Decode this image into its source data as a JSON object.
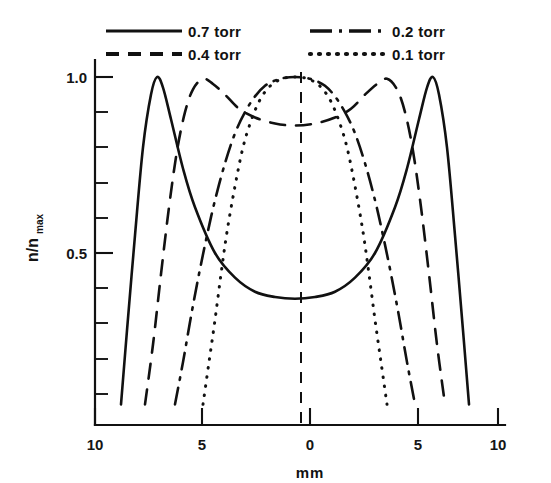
{
  "chart_data": {
    "type": "line",
    "title": "",
    "xlabel": "mm",
    "ylabel": "n/n max",
    "ylabel_main": "n/n",
    "ylabel_sub": "max",
    "xlim": [
      -10,
      10
    ],
    "ylim": [
      0,
      1.05
    ],
    "grid": false,
    "legend_position": "top",
    "x_ticks_major": [
      -10,
      -5,
      0,
      5,
      10
    ],
    "x_tick_labels": [
      "10",
      "5",
      "0",
      "5",
      "10"
    ],
    "y_ticks_major": [
      0.5,
      1.0
    ],
    "y_tick_labels": [
      "0.5",
      "1.0"
    ],
    "y_ticks_minor": [
      0.05,
      0.15,
      0.25,
      0.35,
      0.45,
      0.55,
      0.65,
      0.75,
      0.85,
      0.95
    ],
    "annotations": [
      "vertical dashed center line at 0 mm"
    ],
    "series": [
      {
        "name": "0.7 torr",
        "style": "solid",
        "peak_positions_mm": [
          -6.9,
          6.9
        ],
        "peak_value": 1.0,
        "center_value": 0.37,
        "x": [
          -8.7,
          -8.4,
          -8.0,
          -7.6,
          -7.2,
          -6.9,
          -6.6,
          -6.2,
          -5.6,
          -5.0,
          -4.0,
          -3.0,
          -2.0,
          -1.0,
          0.0,
          1.0,
          2.0,
          3.0,
          4.0,
          5.0,
          5.6,
          6.2,
          6.6,
          6.9,
          7.2,
          7.6,
          8.0,
          8.4,
          8.7
        ],
        "y": [
          0.07,
          0.28,
          0.55,
          0.8,
          0.95,
          1.0,
          0.97,
          0.88,
          0.74,
          0.63,
          0.5,
          0.43,
          0.39,
          0.375,
          0.37,
          0.375,
          0.39,
          0.43,
          0.5,
          0.63,
          0.74,
          0.88,
          0.97,
          1.0,
          0.95,
          0.8,
          0.55,
          0.28,
          0.07
        ]
      },
      {
        "name": "0.4 torr",
        "style": "dashed",
        "peak_positions_mm": [
          -4.6,
          4.6
        ],
        "peak_value": 0.995,
        "center_value": 0.86,
        "x": [
          -7.5,
          -7.1,
          -6.7,
          -6.3,
          -5.9,
          -5.5,
          -5.1,
          -4.6,
          -4.1,
          -3.5,
          -2.8,
          -2.0,
          -1.0,
          0.0,
          1.0,
          2.0,
          2.8,
          3.5,
          4.1,
          4.6,
          5.1,
          5.5,
          5.9,
          6.3,
          6.7,
          7.1,
          7.5
        ],
        "y": [
          0.07,
          0.24,
          0.44,
          0.63,
          0.79,
          0.9,
          0.965,
          0.995,
          0.98,
          0.95,
          0.91,
          0.885,
          0.868,
          0.862,
          0.868,
          0.885,
          0.91,
          0.95,
          0.98,
          0.995,
          0.965,
          0.9,
          0.79,
          0.63,
          0.44,
          0.24,
          0.07
        ]
      },
      {
        "name": "0.2 torr",
        "style": "dash-dot",
        "peak_positions_mm": [
          0.0
        ],
        "peak_value": 1.0,
        "center_value": 1.0,
        "x": [
          -6.0,
          -5.6,
          -5.2,
          -4.8,
          -4.4,
          -4.0,
          -3.5,
          -3.0,
          -2.5,
          -2.0,
          -1.5,
          -1.0,
          -0.5,
          0.0,
          0.5,
          1.0,
          1.5,
          2.0,
          2.5,
          3.0,
          3.5,
          4.0,
          4.4,
          4.8,
          5.2,
          5.6,
          6.0
        ],
        "y": [
          0.07,
          0.19,
          0.32,
          0.44,
          0.55,
          0.65,
          0.755,
          0.84,
          0.9,
          0.945,
          0.975,
          0.99,
          0.998,
          1.0,
          0.998,
          0.99,
          0.975,
          0.945,
          0.9,
          0.84,
          0.755,
          0.65,
          0.55,
          0.44,
          0.32,
          0.19,
          0.07
        ]
      },
      {
        "name": "0.1 torr",
        "style": "dotted",
        "peak_positions_mm": [
          0.0
        ],
        "peak_value": 1.0,
        "center_value": 1.0,
        "x": [
          -4.6,
          -4.3,
          -4.0,
          -3.7,
          -3.4,
          -3.0,
          -2.6,
          -2.2,
          -1.8,
          -1.4,
          -1.0,
          -0.6,
          -0.3,
          0.0,
          0.3,
          0.6,
          1.0,
          1.4,
          1.8,
          2.2,
          2.6,
          3.0,
          3.4,
          3.7,
          4.0,
          4.3,
          4.6
        ],
        "y": [
          0.07,
          0.19,
          0.31,
          0.44,
          0.56,
          0.69,
          0.8,
          0.875,
          0.93,
          0.965,
          0.985,
          0.996,
          0.999,
          1.0,
          0.999,
          0.996,
          0.985,
          0.965,
          0.93,
          0.875,
          0.8,
          0.69,
          0.56,
          0.44,
          0.31,
          0.19,
          0.07
        ]
      }
    ]
  },
  "legend": {
    "items": [
      {
        "label": "0.7 torr",
        "style": "solid"
      },
      {
        "label": "0.4 torr",
        "style": "dashed"
      },
      {
        "label": "0.2  torr",
        "style": "dash-dot"
      },
      {
        "label": "0.1  torr",
        "style": "dotted"
      }
    ]
  },
  "axes": {
    "x_label": "mm",
    "y_label_main": "n/n",
    "y_label_sub": "max",
    "x_tick_labels": [
      "10",
      "5",
      "0",
      "5",
      "10"
    ],
    "y_tick_labels": [
      "1.0",
      "0.5"
    ]
  },
  "colors": {
    "ink": "#111111",
    "background": "#ffffff"
  }
}
